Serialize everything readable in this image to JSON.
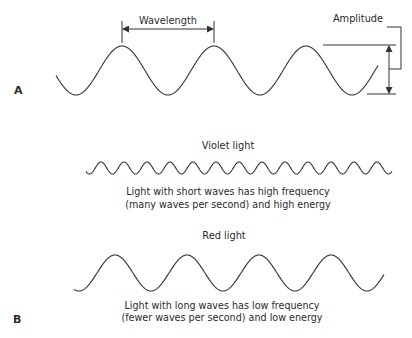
{
  "panel_a": {
    "label": "A",
    "wavelength_label": "Wavelength",
    "amplitude_label": "Amplitude"
  },
  "panel_b": {
    "label": "B",
    "violet": {
      "title": "Violet light",
      "caption_line1": "Light with short waves has high frequency",
      "caption_line2": "(many waves per second) and high energy"
    },
    "red": {
      "title": "Red light",
      "caption_line1": "Light with long waves has low frequency",
      "caption_line2": "(fewer waves per second) and low energy"
    }
  },
  "colors": {
    "line": "#333333",
    "text": "#2a2a2a",
    "background": "#ffffff"
  }
}
